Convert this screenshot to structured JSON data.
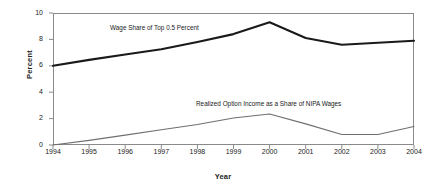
{
  "chart_data": {
    "type": "line",
    "title": "",
    "xlabel": "Year",
    "ylabel": "Percent",
    "x": [
      1994,
      1995,
      1996,
      1997,
      1998,
      1999,
      2000,
      2001,
      2002,
      2003,
      2004
    ],
    "xtick_labels": [
      "1994",
      "1995",
      "1996",
      "1997",
      "1998",
      "1999",
      "2000",
      "2001",
      "2002",
      "2003",
      "2004"
    ],
    "ytick_labels": [
      "0",
      "2",
      "4",
      "6",
      "8",
      "10"
    ],
    "yticks": [
      0,
      2,
      4,
      6,
      8,
      10
    ],
    "ylim": [
      0,
      10
    ],
    "xlim": [
      1994,
      2004
    ],
    "grid": false,
    "legend_position": "inline-annotations",
    "series": [
      {
        "name": "Wage Share of Top 0.5 Percent",
        "color": "#1a1a1a",
        "width": 2.1,
        "values": [
          6.0,
          6.45,
          6.85,
          7.25,
          7.8,
          8.4,
          9.3,
          8.1,
          7.6,
          7.75,
          7.9
        ]
      },
      {
        "name": "Realized Option Income as a Share of NIPA Wages",
        "color": "#6f6f6f",
        "width": 1.1,
        "values": [
          0.0,
          0.35,
          0.75,
          1.15,
          1.55,
          2.05,
          2.35,
          1.6,
          0.8,
          0.8,
          1.4
        ]
      }
    ],
    "annotations": [
      {
        "text": "Wage Share of Top 0.5 Percent",
        "x": 1997.0,
        "y": 8.6
      },
      {
        "text": "Realized Option Income as a Share of NIPA Wages",
        "x": 1999.5,
        "y": 3.4
      }
    ]
  },
  "axis": {
    "ylabel": "Percent",
    "xlabel": "Year"
  }
}
